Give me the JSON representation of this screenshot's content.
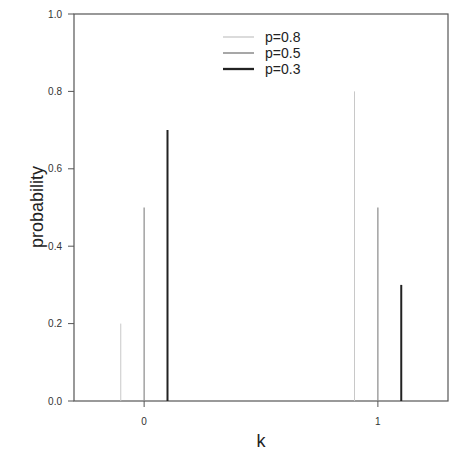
{
  "chart_data": {
    "type": "bar",
    "subtype": "stem",
    "title": "",
    "xlabel": "k",
    "ylabel": "probability",
    "categories": [
      "0",
      "1"
    ],
    "x": [
      0,
      1
    ],
    "series": [
      {
        "name": "p=0.8",
        "values": [
          0.2,
          0.8
        ],
        "color": "#c8c8c8",
        "offset": -0.1
      },
      {
        "name": "p=0.5",
        "values": [
          0.5,
          0.5
        ],
        "color": "#8a8a8a",
        "offset": 0.0
      },
      {
        "name": "p=0.3",
        "values": [
          0.7,
          0.3
        ],
        "color": "#222222",
        "offset": 0.1
      }
    ],
    "ylim": [
      0.0,
      1.0
    ],
    "xlim": [
      -0.3,
      1.3
    ],
    "yticks": [
      "0.0",
      "0.2",
      "0.4",
      "0.6",
      "0.8",
      "1.0"
    ],
    "xticks": [
      "0",
      "1"
    ],
    "grid": false,
    "legend_position": "upper center"
  }
}
